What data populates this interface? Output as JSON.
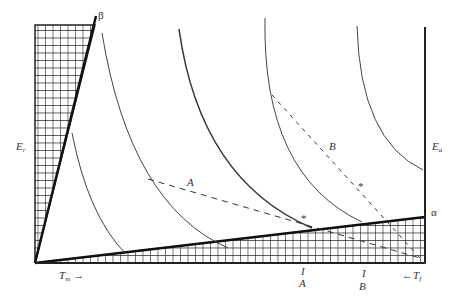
{
  "figure": {
    "labels": {
      "beta": "β",
      "alpha": "α",
      "E_r": "E",
      "E_r_sub": "r",
      "E_a": "E",
      "E_a_sub": "a",
      "T_m": "T",
      "T_m_sub": "m",
      "T_m_arrow": "→",
      "T_f": "T",
      "T_f_sub": "f",
      "T_f_arrow": "←",
      "path_A": "A",
      "path_B": "B",
      "tick_A_mark": "I",
      "tick_A_label": "A",
      "tick_B_mark": "I",
      "tick_B_label": "B",
      "star": "*"
    },
    "colors": {
      "line": "#222222",
      "curve": "#444444",
      "hatch": "#222222"
    }
  }
}
